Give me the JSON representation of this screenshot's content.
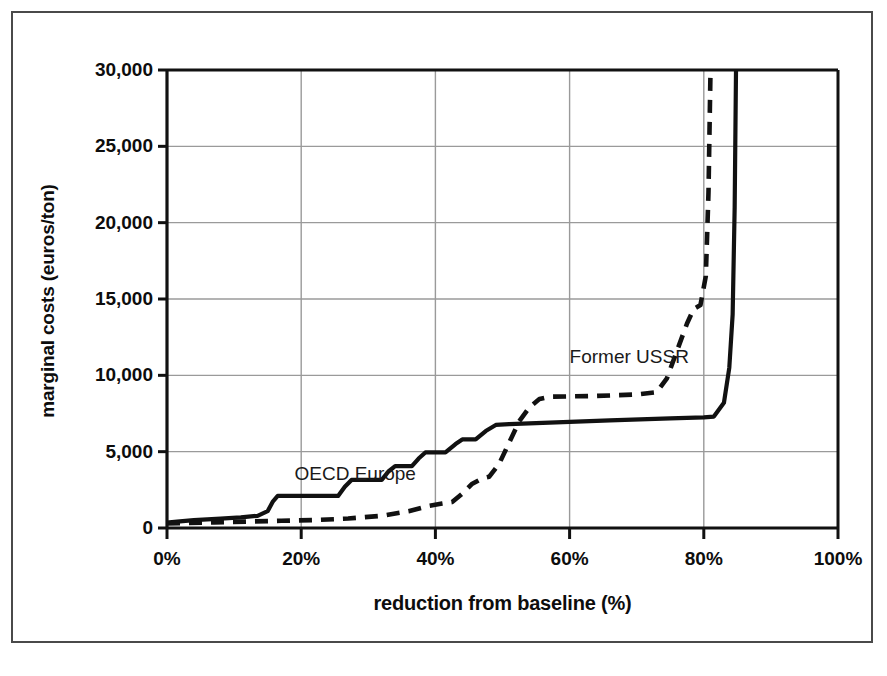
{
  "chart_data": {
    "type": "line",
    "title": "",
    "xlabel": "reduction from baseline (%)",
    "ylabel": "marginal costs (euros/ton)",
    "xlim": [
      0,
      100
    ],
    "ylim": [
      0,
      30000
    ],
    "xticks": [
      "0%",
      "20%",
      "40%",
      "60%",
      "80%",
      "100%"
    ],
    "xtick_values": [
      0,
      20,
      40,
      60,
      80,
      100
    ],
    "yticks": [
      "0",
      "5,000",
      "10,000",
      "15,000",
      "20,000",
      "25,000",
      "30,000"
    ],
    "ytick_values": [
      0,
      5000,
      10000,
      15000,
      20000,
      25000,
      30000
    ],
    "grid": true,
    "legend_position": "inline-annotations",
    "series": [
      {
        "name": "OECD Europe",
        "style": "solid",
        "color": "#111111",
        "label_x": 19,
        "label_y": 4250,
        "points": [
          [
            0,
            350
          ],
          [
            1.5,
            420
          ],
          [
            4,
            520
          ],
          [
            8,
            620
          ],
          [
            11,
            700
          ],
          [
            13.5,
            800
          ],
          [
            15,
            1100
          ],
          [
            15.8,
            1750
          ],
          [
            16.5,
            2100
          ],
          [
            25.5,
            2100
          ],
          [
            26.5,
            2700
          ],
          [
            27.5,
            3150
          ],
          [
            32,
            3150
          ],
          [
            33,
            3700
          ],
          [
            34,
            4050
          ],
          [
            36.5,
            4050
          ],
          [
            37.5,
            4550
          ],
          [
            38.5,
            4950
          ],
          [
            41.5,
            4950
          ],
          [
            43,
            5500
          ],
          [
            44,
            5800
          ],
          [
            46,
            5800
          ],
          [
            47.5,
            6350
          ],
          [
            49,
            6750
          ],
          [
            51,
            6800
          ],
          [
            57,
            6900
          ],
          [
            66,
            7050
          ],
          [
            75,
            7180
          ],
          [
            80,
            7250
          ],
          [
            81.5,
            7300
          ],
          [
            83,
            8200
          ],
          [
            83.8,
            10500
          ],
          [
            84.3,
            14000
          ],
          [
            84.6,
            21000
          ],
          [
            84.8,
            30000
          ]
        ]
      },
      {
        "name": "Former USSR",
        "style": "dashed",
        "color": "#111111",
        "label_x": 60,
        "label_y": 11900,
        "points": [
          [
            0,
            300
          ],
          [
            3,
            330
          ],
          [
            7,
            370
          ],
          [
            12,
            420
          ],
          [
            17,
            470
          ],
          [
            22,
            520
          ],
          [
            27,
            620
          ],
          [
            32,
            800
          ],
          [
            36,
            1100
          ],
          [
            39,
            1450
          ],
          [
            41,
            1600
          ],
          [
            42.5,
            1700
          ],
          [
            44,
            2250
          ],
          [
            45.5,
            2900
          ],
          [
            47,
            3250
          ],
          [
            48,
            3350
          ],
          [
            49.5,
            4200
          ],
          [
            51,
            5600
          ],
          [
            52.5,
            7000
          ],
          [
            54,
            7900
          ],
          [
            55.5,
            8450
          ],
          [
            57,
            8600
          ],
          [
            64,
            8650
          ],
          [
            70,
            8750
          ],
          [
            73,
            8900
          ],
          [
            74.5,
            9800
          ],
          [
            76,
            11600
          ],
          [
            77.5,
            13400
          ],
          [
            78.5,
            14350
          ],
          [
            79.5,
            14600
          ],
          [
            80.3,
            16500
          ],
          [
            80.7,
            22000
          ],
          [
            81,
            30000
          ]
        ]
      }
    ]
  },
  "annotations": {
    "oecd_europe": "OECD Europe",
    "former_ussr": "Former USSR"
  }
}
